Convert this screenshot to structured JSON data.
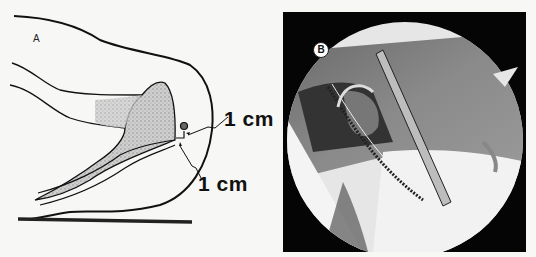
{
  "figure": {
    "panel_a": {
      "label": "A",
      "annotations": [
        {
          "text": "1 cm"
        },
        {
          "text": "1 cm"
        }
      ]
    },
    "panel_b": {
      "label": "B"
    }
  }
}
